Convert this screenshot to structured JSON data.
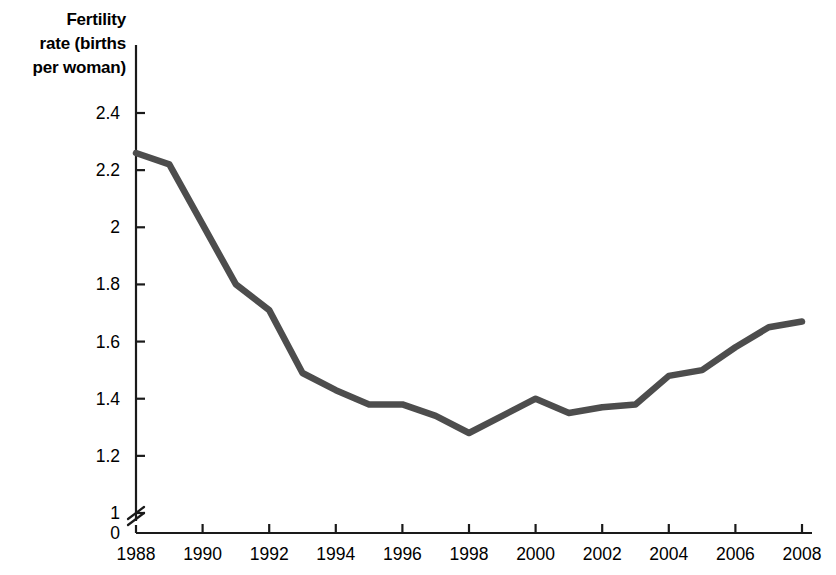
{
  "chart_data": {
    "type": "line",
    "title": "",
    "ylabel": "Fertility\nrate (births\nper woman)",
    "xlabel": "",
    "x": [
      1988,
      1989,
      1990,
      1991,
      1992,
      1993,
      1994,
      1995,
      1996,
      1997,
      1998,
      1999,
      2000,
      2001,
      2002,
      2003,
      2004,
      2005,
      2006,
      2007,
      2008
    ],
    "values": [
      2.26,
      2.22,
      2.01,
      1.8,
      1.71,
      1.49,
      1.43,
      1.38,
      1.38,
      1.34,
      1.28,
      1.34,
      1.4,
      1.35,
      1.37,
      1.38,
      1.48,
      1.5,
      1.58,
      1.65,
      1.67
    ],
    "series": [
      {
        "name": "Fertility rate",
        "values": [
          2.26,
          2.22,
          2.01,
          1.8,
          1.71,
          1.49,
          1.43,
          1.38,
          1.38,
          1.34,
          1.28,
          1.34,
          1.4,
          1.35,
          1.37,
          1.38,
          1.48,
          1.5,
          1.58,
          1.65,
          1.67
        ]
      }
    ],
    "xticks": [
      1988,
      1990,
      1992,
      1994,
      1996,
      1998,
      2000,
      2002,
      2004,
      2006,
      2008
    ],
    "xtick_labels": [
      "1988",
      "1990",
      "1992",
      "1994",
      "1996",
      "1998",
      "2000",
      "2002",
      "2004",
      "2006",
      "2008"
    ],
    "yticks": [
      0,
      1,
      1.2,
      1.4,
      1.6,
      1.8,
      2,
      2.2,
      2.4
    ],
    "ytick_labels": [
      "0",
      "1",
      "1.2",
      "1.4",
      "1.6",
      "1.8",
      "2",
      "2.2",
      "2.4"
    ],
    "xlim": [
      1988,
      2008
    ],
    "ylim": [
      1.0,
      2.4
    ],
    "y_axis_break": true,
    "y_axis_break_between": [
      0,
      1
    ],
    "grid": false,
    "legend": "none",
    "line_color": "#4d4d4d",
    "axis_color": "#1a1a1a",
    "background_color": "#ffffff"
  }
}
